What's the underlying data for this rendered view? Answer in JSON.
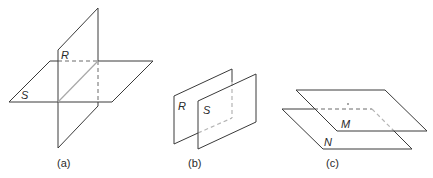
{
  "figure": {
    "panels": [
      {
        "id": "a",
        "caption": "(a)",
        "description": "Two intersecting planes",
        "planes": [
          {
            "name": "R",
            "label": "R",
            "orientation": "vertical"
          },
          {
            "name": "S",
            "label": "S",
            "orientation": "horizontal"
          }
        ]
      },
      {
        "id": "b",
        "caption": "(b)",
        "description": "Two parallel vertical planes",
        "planes": [
          {
            "name": "R",
            "label": "R",
            "orientation": "vertical"
          },
          {
            "name": "S",
            "label": "S",
            "orientation": "vertical"
          }
        ]
      },
      {
        "id": "c",
        "caption": "(c)",
        "description": "Two parallel horizontal planes",
        "planes": [
          {
            "name": "M",
            "label": "M",
            "orientation": "horizontal"
          },
          {
            "name": "N",
            "label": "N",
            "orientation": "horizontal"
          }
        ]
      }
    ],
    "colors": {
      "line": "#3a3a3a",
      "hidden_line": "#6a6a6a",
      "intersection_line": "#a8a8a8",
      "background": "#ffffff"
    }
  }
}
